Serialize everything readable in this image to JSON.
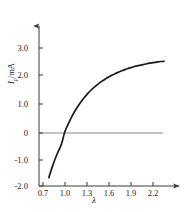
{
  "chart_data": {
    "type": "line",
    "title": "",
    "xlabel": "λ",
    "ylabel": "Iₚ/mA",
    "ylabel_symbol": "I",
    "ylabel_subscript": "p",
    "ylabel_unit": "/mA",
    "xlim": [
      0.64,
      2.42
    ],
    "ylim": [
      -2.0,
      3.4
    ],
    "xticks": [
      0.7,
      1.0,
      1.3,
      1.6,
      1.9,
      2.2
    ],
    "xtick_labels": [
      "0.7",
      "1.0",
      "1.3",
      "1.6",
      "1.9",
      "2.2"
    ],
    "yticks": [
      -2.0,
      -1.0,
      0,
      1.0,
      2.0,
      3.0
    ],
    "ytick_labels": [
      "-2.0",
      "-1.0",
      "0",
      "1.0",
      "2.0",
      "3.0"
    ],
    "grid": false,
    "legend": null,
    "axis_style": "arrow-ended",
    "zero_line": true,
    "curve_color": "#1a1a1a",
    "axis_color": "#3a3a3a",
    "series": [
      {
        "name": "I_p",
        "x": [
          0.78,
          0.8,
          0.83,
          0.86,
          0.89,
          0.92,
          0.95,
          1.0,
          1.05,
          1.1,
          1.15,
          1.2,
          1.25,
          1.3,
          1.35,
          1.4,
          1.45,
          1.5,
          1.55,
          1.6,
          1.65,
          1.7,
          1.75,
          1.8,
          1.85,
          1.9,
          1.95,
          2.0,
          2.05,
          2.1,
          2.15,
          2.2,
          2.25,
          2.3,
          2.35
        ],
        "y": [
          -1.7,
          -1.52,
          -1.28,
          -1.06,
          -0.86,
          -0.68,
          -0.5,
          -0.02,
          0.28,
          0.55,
          0.78,
          0.98,
          1.16,
          1.32,
          1.46,
          1.58,
          1.69,
          1.79,
          1.88,
          1.96,
          2.03,
          2.09,
          2.15,
          2.2,
          2.25,
          2.29,
          2.33,
          2.36,
          2.39,
          2.42,
          2.45,
          2.47,
          2.49,
          2.51,
          2.52
        ]
      }
    ],
    "zero_crossing_x": 1.0,
    "max_value": 2.52,
    "min_value": -1.7
  }
}
